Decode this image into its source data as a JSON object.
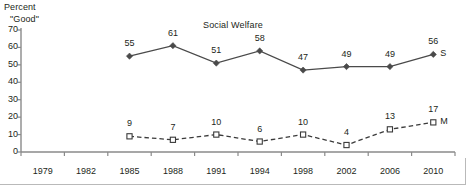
{
  "chart_data": {
    "type": "line",
    "title": "Social Welfare",
    "ylabel_line1": "Percent",
    "ylabel_line2": "\"Good\"",
    "xlabel": "",
    "categories": [
      "1979",
      "1982",
      "1985",
      "1988",
      "1991",
      "1994",
      "1998",
      "2002",
      "2006",
      "2010"
    ],
    "yticks": [
      "0",
      "10",
      "20",
      "30",
      "40",
      "50",
      "60",
      "70"
    ],
    "ylim": [
      0,
      70
    ],
    "grid": false,
    "legend_position": "right-endcap",
    "series": [
      {
        "name": "S",
        "endcap_label": "S",
        "marker": "filled-diamond",
        "linestyle": "solid",
        "color": "#4a4a4a",
        "x": [
          "1985",
          "1988",
          "1991",
          "1994",
          "1998",
          "2002",
          "2006",
          "2010"
        ],
        "values": [
          55,
          61,
          51,
          58,
          47,
          49,
          49,
          56
        ],
        "point_labels": [
          "55",
          "61",
          "51",
          "58",
          "47",
          "49",
          "49",
          "56"
        ]
      },
      {
        "name": "M",
        "endcap_label": "M",
        "marker": "open-square",
        "linestyle": "dashed",
        "color": "#3a3a3a",
        "x": [
          "1985",
          "1988",
          "1991",
          "1994",
          "1998",
          "2002",
          "2006",
          "2010"
        ],
        "values": [
          9,
          7,
          10,
          6,
          10,
          4,
          13,
          17
        ],
        "point_labels": [
          "9",
          "7",
          "10",
          "6",
          "10",
          "4",
          "13",
          "17"
        ]
      }
    ]
  },
  "colors": {
    "axis": "#8a8a8a",
    "text": "#231f20",
    "frame": "#b9b9b9"
  }
}
